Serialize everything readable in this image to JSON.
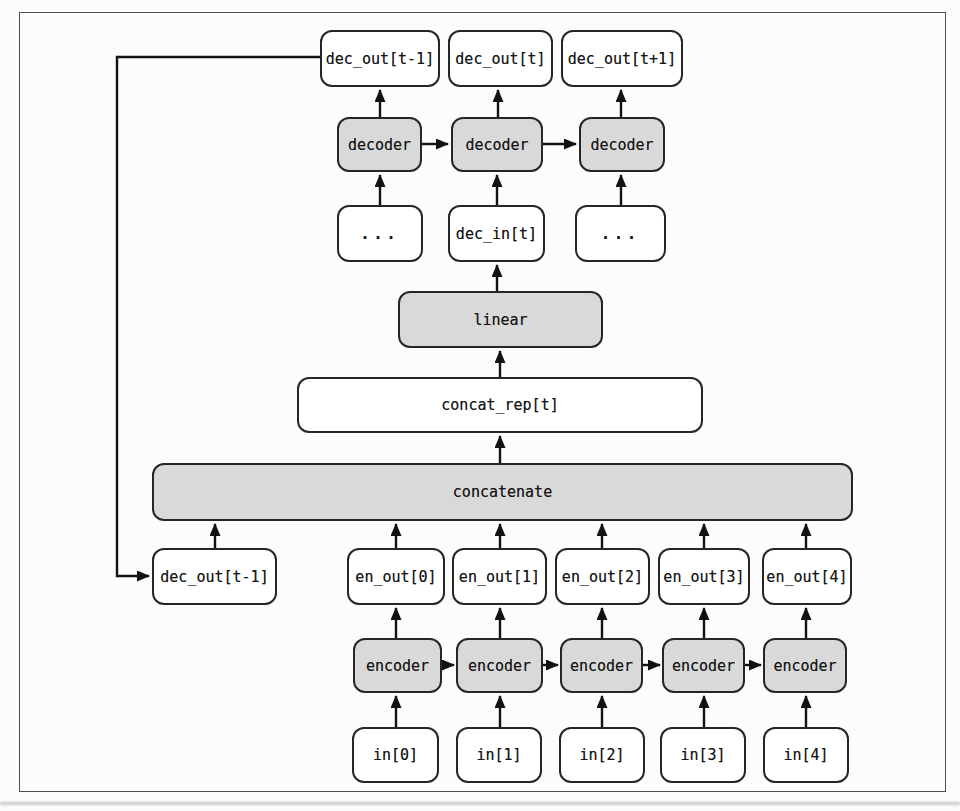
{
  "figure": {
    "colors": {
      "background": "#fcfcfc",
      "frame_border": "#4f4f4f",
      "box_border": "#262626",
      "box_fill_plain": "#ffffff",
      "box_fill_shaded": "#d9d9d9",
      "arrow": "#121212",
      "text": "#161616"
    },
    "nodes": {
      "dec_out_prev_top": "dec_out[t-1]",
      "dec_out_t": "dec_out[t]",
      "dec_out_next": "dec_out[t+1]",
      "decoder_0": "decoder",
      "decoder_1": "decoder",
      "decoder_2": "decoder",
      "dots_left": "...",
      "dec_in_t": "dec_in[t]",
      "dots_right": "...",
      "linear": "linear",
      "concat_rep": "concat_rep[t]",
      "concatenate": "concatenate",
      "dec_out_prev_bottom": "dec_out[t-1]",
      "en_out_0": "en_out[0]",
      "en_out_1": "en_out[1]",
      "en_out_2": "en_out[2]",
      "en_out_3": "en_out[3]",
      "en_out_4": "en_out[4]",
      "encoder_0": "encoder",
      "encoder_1": "encoder",
      "encoder_2": "encoder",
      "encoder_3": "encoder",
      "encoder_4": "encoder",
      "in_0": "in[0]",
      "in_1": "in[1]",
      "in_2": "in[2]",
      "in_3": "in[3]",
      "in_4": "in[4]"
    }
  }
}
